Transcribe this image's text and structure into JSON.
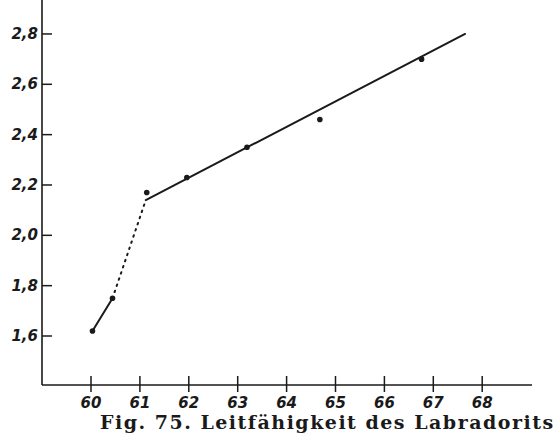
{
  "chart_data": {
    "type": "line",
    "title": "Fig. 75. Leitfähigkeit des Labradorits",
    "xlabel": "",
    "ylabel": "",
    "xlim": [
      59,
      69
    ],
    "ylim": [
      1.4,
      2.92
    ],
    "grid": false,
    "legend": null,
    "x_ticks": [
      60,
      61,
      62,
      63,
      64,
      65,
      66,
      67,
      68
    ],
    "x_tick_labels": [
      "60",
      "61",
      "62",
      "63",
      "64",
      "65",
      "66",
      "67",
      "68"
    ],
    "y_ticks": [
      1.6,
      1.8,
      2.0,
      2.2,
      2.4,
      2.6,
      2.8
    ],
    "y_tick_labels": [
      "1,6",
      "1,8",
      "2,0",
      "2,2",
      "2,4",
      "2,6",
      "2,8"
    ],
    "points": [
      {
        "x": 60.03,
        "y": 1.62
      },
      {
        "x": 60.44,
        "y": 1.75
      },
      {
        "x": 61.14,
        "y": 2.17
      },
      {
        "x": 61.96,
        "y": 2.23
      },
      {
        "x": 63.19,
        "y": 2.35
      },
      {
        "x": 64.68,
        "y": 2.46
      },
      {
        "x": 66.76,
        "y": 2.7
      }
    ],
    "series": [
      {
        "name": "low segment (solid)",
        "style": "solid",
        "x": [
          60.03,
          60.44
        ],
        "y": [
          1.62,
          1.75
        ]
      },
      {
        "name": "transition (dotted)",
        "style": "dotted",
        "x": [
          60.44,
          61.12
        ],
        "y": [
          1.75,
          2.14
        ]
      },
      {
        "name": "fit line (solid)",
        "style": "solid",
        "x": [
          61.12,
          67.65
        ],
        "y": [
          2.14,
          2.8
        ]
      }
    ]
  },
  "caption": "Fig. 75. Leitfähigkeit des Labradorits",
  "colors": {
    "ink": "#1a1a1a",
    "background": "#ffffff"
  }
}
